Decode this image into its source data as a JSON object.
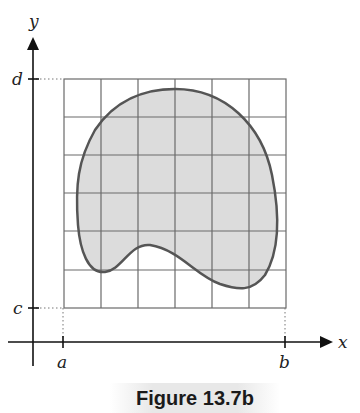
{
  "figure": {
    "caption": "Figure 13.7b",
    "axes": {
      "x_label": "x",
      "y_label": "y"
    },
    "ticks": {
      "a": "a",
      "b": "b",
      "c": "c",
      "d": "d"
    },
    "grid": {
      "columns": 6,
      "rows": 6
    },
    "colors": {
      "region_fill": "#d9d9d9",
      "outline": "#555555",
      "grid": "#666666",
      "axis": "#111111"
    }
  }
}
